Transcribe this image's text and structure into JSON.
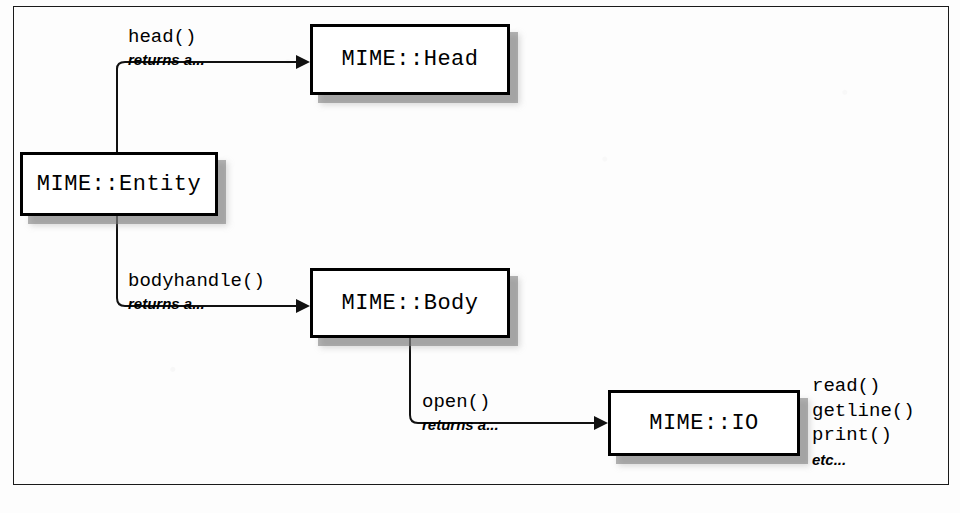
{
  "figure": {
    "frame_color": "#1a1a1a",
    "box_border_color": "#000000",
    "box_fill_color": "#ffffff",
    "shadow_color": "#787878",
    "background_color": "#fdfdfd"
  },
  "nodes": [
    {
      "id": "entity",
      "label": "MIME::Entity"
    },
    {
      "id": "head",
      "label": "MIME::Head"
    },
    {
      "id": "body",
      "label": "MIME::Body"
    },
    {
      "id": "io",
      "label": "MIME::IO"
    }
  ],
  "edges": [
    {
      "id": "entity-to-head",
      "from": "entity",
      "to": "head",
      "call": "head()",
      "returns": "returns a..."
    },
    {
      "id": "entity-to-body",
      "from": "entity",
      "to": "body",
      "call": "bodyhandle()",
      "returns": "returns a..."
    },
    {
      "id": "body-to-io",
      "from": "body",
      "to": "io",
      "call": "open()",
      "returns": "returns a..."
    }
  ],
  "io_methods": {
    "items": [
      "read()",
      "getline()",
      "print()"
    ],
    "etc": "etc..."
  }
}
